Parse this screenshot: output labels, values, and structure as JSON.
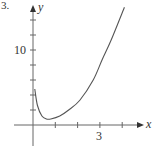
{
  "problem_number": "3.",
  "chart_data": {
    "type": "line",
    "title": "",
    "xlabel": "x",
    "ylabel": "y",
    "xlim": [
      0,
      4.8
    ],
    "ylim": [
      -2.5,
      16
    ],
    "x_ticks": [
      1,
      2,
      3,
      4
    ],
    "x_tick_labels": {
      "3": "3"
    },
    "y_ticks": [
      2,
      4,
      6,
      8,
      10,
      12,
      14
    ],
    "y_tick_labels": {
      "10": "10"
    },
    "grid": false,
    "legend": null,
    "series": [
      {
        "name": "f(x)",
        "x": [
          0.08,
          0.2,
          0.4,
          0.6,
          0.8,
          1.2,
          1.6,
          2.1,
          2.7,
          3.1,
          3.5,
          4.1
        ],
        "y": [
          4.8,
          2.6,
          1.2,
          0.8,
          0.8,
          1.2,
          2.0,
          3.3,
          6.0,
          8.7,
          11.3,
          15.7
        ]
      }
    ],
    "colors": {
      "curve": "#555555",
      "axes": "#555555"
    }
  }
}
